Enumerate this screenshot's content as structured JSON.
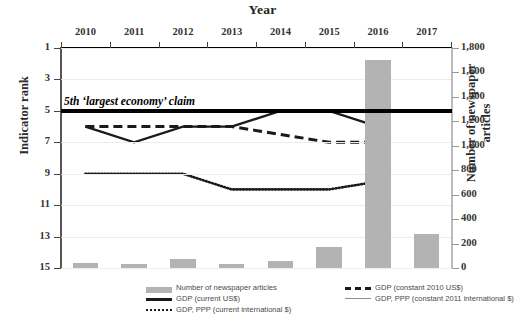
{
  "chart_data": {
    "type": "line",
    "title": "Year",
    "xlabel": "Year",
    "ylabel": "Indicator rank",
    "ylabel_secondary": "Number of newspaper articles",
    "categories": [
      "2010",
      "2011",
      "2012",
      "2013",
      "2014",
      "2015",
      "2016",
      "2017"
    ],
    "ylim": [
      1,
      15
    ],
    "yticks": [
      "1",
      "3",
      "5",
      "7",
      "9",
      "11",
      "13",
      "15"
    ],
    "ylim_secondary": [
      0,
      1800
    ],
    "yticks_secondary": [
      "1,800",
      "1,600",
      "1,400",
      "1,200",
      "1,000",
      "800",
      "600",
      "400",
      "200",
      "0"
    ],
    "grid": true,
    "legend_position": "bottom",
    "annotation": {
      "text": "5th ‘largest economy’ claim",
      "rank_value": 5
    },
    "series": [
      {
        "name": "Number of newspaper articles",
        "axis": "secondary",
        "type": "bar",
        "color": "#b3b3b3",
        "values": [
          40,
          30,
          70,
          35,
          60,
          175,
          1700,
          280
        ]
      },
      {
        "name": "GDP (current US$)",
        "axis": "primary",
        "type": "line",
        "style": "solid",
        "color": "#1a1a1a",
        "values": [
          6,
          7,
          6,
          6,
          5,
          5,
          6,
          null
        ]
      },
      {
        "name": "GDP (constant 2010 US$)",
        "axis": "primary",
        "type": "line",
        "style": "dashed",
        "color": "#1a1a1a",
        "values": [
          6,
          6,
          6,
          6,
          6.5,
          7,
          7,
          null
        ]
      },
      {
        "name": "GDP, PPP (current international $)",
        "axis": "primary",
        "type": "line",
        "style": "dotted",
        "color": "#1a1a1a",
        "values": [
          9,
          9,
          9,
          10,
          10,
          10,
          9.5,
          null
        ]
      },
      {
        "name": "GDP, PPP (constant 2011 international $)",
        "axis": "primary",
        "type": "line",
        "style": "solid-thin",
        "color": "#8c8c8c",
        "values": [
          null,
          null,
          null,
          null,
          null,
          null,
          null,
          null
        ]
      }
    ]
  },
  "legend": {
    "items": [
      {
        "label": "Number of newspaper articles",
        "key": "bar-swatch"
      },
      {
        "label": "GDP (current US$)",
        "key": "solid-line"
      },
      {
        "label": "GDP, PPP (current international $)",
        "key": "dotted-line"
      },
      {
        "label": "GDP (constant 2010 US$)",
        "key": "dashed-line"
      },
      {
        "label": "GDP, PPP (constant 2011 international $)",
        "key": "thin-solid-line"
      }
    ]
  }
}
